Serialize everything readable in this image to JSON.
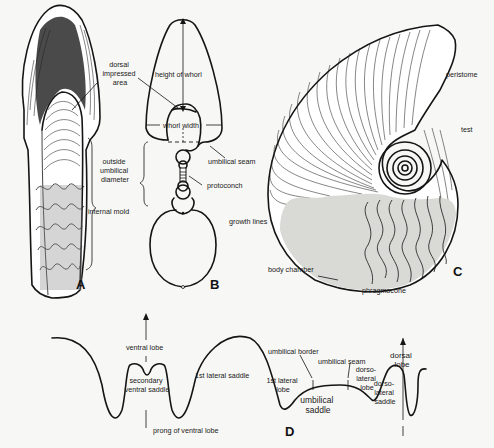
{
  "figure": {
    "panels": [
      {
        "id": "A",
        "letter": "A",
        "description": "ventral/lateral view of ammonoid with internal mold",
        "labels": [
          "dorsal impressed area",
          "outside umbilical diameter",
          "internal mold"
        ]
      },
      {
        "id": "B",
        "letter": "B",
        "description": "cross-section of whorls",
        "labels": [
          "height of whorl",
          "whorl width",
          "umbilical seam",
          "protoconch",
          "growth lines"
        ]
      },
      {
        "id": "C",
        "letter": "C",
        "description": "lateral view of ammonoid shell",
        "labels": [
          "peristome",
          "test",
          "body chamber",
          "phragmocone"
        ]
      },
      {
        "id": "D",
        "letter": "D",
        "description": "suture line terminology",
        "labels": [
          "ventral lobe",
          "secondary ventral saddle",
          "prong of ventral lobe",
          "1st lateral saddle",
          "1st lateral lobe",
          "umbilical border",
          "umbilical saddle",
          "umbilical seam",
          "dorso-lateral lobe",
          "dorso-lateral saddle",
          "dorsal lobe"
        ]
      }
    ]
  },
  "labels": {
    "A_dorsal": [
      "dorsal",
      "impressed",
      "area"
    ],
    "A_outside": [
      "outside",
      "umbilical",
      "diameter"
    ],
    "A_mold": "internal mold",
    "B_height": "height of whorl",
    "B_width": "whorl width",
    "B_seam": "umbilical seam",
    "B_proto": "protoconch",
    "B_growth": "growth lines",
    "C_peristome": "peristome",
    "C_test": "test",
    "C_body": "body chamber",
    "C_phrag": "phragmocone",
    "D_ventral": "ventral lobe",
    "D_secondary": [
      "secondary",
      "ventral saddle"
    ],
    "D_prong": "prong of ventral lobe",
    "D_1st_saddle": "1st lateral saddle",
    "D_1st_lobe": [
      "1st lateral",
      "lobe"
    ],
    "D_umb_border": "umbilical border",
    "D_umb_saddle": [
      "umbilical",
      "saddle"
    ],
    "D_umb_seam": "umbilical seam",
    "D_dl_lobe": [
      "dorso-",
      "lateral",
      "lobe"
    ],
    "D_dl_saddle": [
      "dorso-",
      "lateral",
      "saddle"
    ],
    "D_dorsal": [
      "dorsal",
      "lobe"
    ]
  },
  "panel_letters": {
    "A": "A",
    "B": "B",
    "C": "C",
    "D": "D"
  }
}
